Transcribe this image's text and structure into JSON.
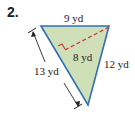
{
  "problem": {
    "number": "2.",
    "figure": "triangle",
    "labels": {
      "top": "9 yd",
      "left": "13 yd",
      "right": "12 yd",
      "height": "8 yd"
    },
    "colors": {
      "fill": "#cfe0b8",
      "edge": "#2f6fb4",
      "height_line": "#d23a3a",
      "dimension": "#222222"
    }
  }
}
